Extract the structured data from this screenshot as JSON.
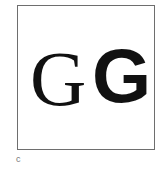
{
  "figure": {
    "glyphs": [
      {
        "char": "G",
        "style": "serif"
      },
      {
        "char": "G",
        "style": "sans-serif-bold"
      }
    ],
    "panel_label": "c"
  }
}
